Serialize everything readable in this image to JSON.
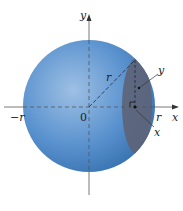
{
  "diagram": {
    "axes": {
      "x_label": "x",
      "y_label": "y",
      "origin_label": "0",
      "neg_r_label": "−r",
      "pos_r_label": "r"
    },
    "annotations": {
      "radius_label": "r",
      "section_y_label": "y",
      "section_x_label": "x"
    },
    "colors": {
      "sphere": "#4a86c5",
      "sphere_highlight": "#8fb6df",
      "sphere_shadow": "#2f6aa8",
      "cross_section": "#5d6a82",
      "axis": "#444444"
    }
  }
}
